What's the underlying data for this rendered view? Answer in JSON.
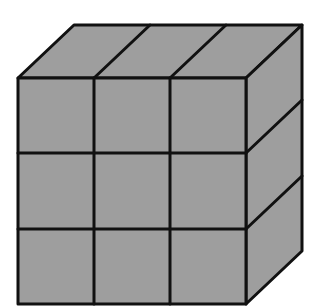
{
  "figure": {
    "colors": {
      "background": "#ffffff",
      "face_fill": "#9e9e9e",
      "stroke": "#111111"
    },
    "stroke_width": 3,
    "front_face": {
      "x": 18,
      "y": 78,
      "width": 228,
      "height": 226,
      "rows": 3,
      "cols": 3
    },
    "depth_offset": {
      "dx": 56,
      "dy": -53
    },
    "top_face_points": "18,78 74,25 302,25 246,78",
    "right_face_points": "246,78 302,25 302,251 246,304",
    "front_vertical_dividers": [
      94,
      170
    ],
    "front_horizontal_dividers": [
      153,
      229
    ],
    "top_dividers": [
      {
        "x1": 94,
        "y1": 78,
        "x2": 150,
        "y2": 25
      },
      {
        "x1": 170,
        "y1": 78,
        "x2": 226,
        "y2": 25
      }
    ],
    "right_dividers": [
      {
        "x1": 246,
        "y1": 153,
        "x2": 302,
        "y2": 100
      },
      {
        "x1": 246,
        "y1": 229,
        "x2": 302,
        "y2": 176
      }
    ]
  }
}
